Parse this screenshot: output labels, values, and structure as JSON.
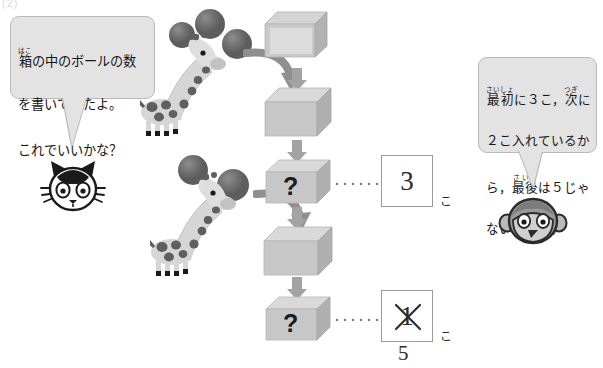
{
  "page": {
    "corner_label": "(2)",
    "background_color": "#ffffff"
  },
  "bubbles": {
    "left": {
      "speaker": "cat",
      "lines": [
        "箱の中のボールの数",
        "を書いてみたよ。",
        "これでいいかな？"
      ],
      "ruby": [
        {
          "base": "箱",
          "reading": "はこ"
        }
      ],
      "full_text": "箱の中のボールの数を書いてみたよ。これでいいかな？",
      "fill_color": "#e3e3e3",
      "border_color": "#b9b9b9"
    },
    "right": {
      "speaker": "monkey",
      "lines": [
        "最初に３こ，次に",
        "２こ入れているか",
        "ら，最後は５じゃ",
        "ないかなあ。"
      ],
      "ruby": [
        {
          "base": "最初",
          "reading": "さいしょ"
        },
        {
          "base": "次",
          "reading": "つぎ"
        },
        {
          "base": "最後",
          "reading": "さいご"
        }
      ],
      "full_text": "最初に３こ，次に２こ入れているから，最後は５じゃないかなあ。",
      "fill_color": "#e3e3e3",
      "border_color": "#b9b9b9"
    }
  },
  "characters": [
    {
      "name": "cat",
      "label": "ねこ",
      "body_color": "#ffffff",
      "outline_color": "#1a1a1a"
    },
    {
      "name": "monkey",
      "label": "さる",
      "body_color": "#9a9a9a",
      "outline_color": "#2b2b2b"
    }
  ],
  "giraffes": [
    {
      "id": "giraffe-top",
      "ball_count": 3,
      "ball_color": "#6f6f6f",
      "body_color": "#d6d6d6",
      "spot_color": "#5f5f5f"
    },
    {
      "id": "giraffe-bottom",
      "ball_count": 2,
      "ball_color": "#6f6f6f",
      "body_color": "#d6d6d6",
      "spot_color": "#5f5f5f"
    }
  ],
  "boxes": [
    {
      "id": "box-1",
      "content": "",
      "state": "empty-open"
    },
    {
      "id": "box-2",
      "content": "",
      "state": "empty"
    },
    {
      "id": "box-3",
      "content": "?",
      "state": "question"
    },
    {
      "id": "box-4",
      "content": "",
      "state": "empty"
    },
    {
      "id": "box-5",
      "content": "?",
      "state": "question"
    }
  ],
  "arrows": [
    {
      "id": "arrow-1",
      "direction": "down"
    },
    {
      "id": "arrow-2",
      "direction": "down"
    },
    {
      "id": "arrow-3",
      "direction": "down"
    },
    {
      "id": "arrow-4",
      "direction": "down"
    }
  ],
  "curved_arrows": [
    {
      "id": "curve-1",
      "from": "giraffe-top",
      "to": "box-2"
    },
    {
      "id": "curve-2",
      "from": "giraffe-bottom",
      "to": "box-4"
    }
  ],
  "answers": [
    {
      "id": "answer-1",
      "linked_box": "box-3",
      "value": "3",
      "unit": "こ",
      "struck_out": false,
      "correction": ""
    },
    {
      "id": "answer-2",
      "linked_box": "box-5",
      "value": "1",
      "unit": "こ",
      "struck_out": true,
      "correction": "5"
    }
  ],
  "colors": {
    "box_top": "#d9d9d9",
    "box_front": "#c7c7c7",
    "box_side": "#b0b0b0",
    "arrow": "#a3a3a3",
    "dot": "#7c7c7c",
    "answer_border": "#9a9a9a"
  }
}
